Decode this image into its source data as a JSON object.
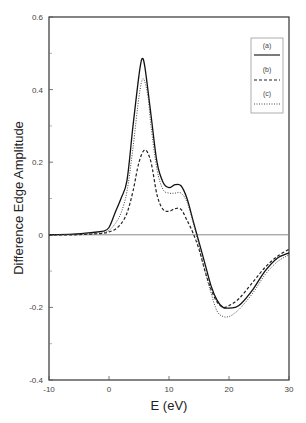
{
  "chart_data": {
    "type": "line",
    "title": "",
    "xlabel": "E (eV)",
    "ylabel": "Difference Edge Amplitude",
    "xlim": [
      -10,
      30
    ],
    "ylim": [
      -0.4,
      0.6
    ],
    "xticks": [
      -10,
      0,
      10,
      20,
      30
    ],
    "xtick_labels": [
      "-10",
      "0",
      "10",
      "20",
      "30"
    ],
    "yticks": [
      -0.4,
      -0.2,
      0,
      0.2,
      0.4,
      0.6
    ],
    "ytick_labels": [
      "-0.4",
      "-0.2",
      "0",
      "0.2",
      "0.4",
      "0.6"
    ],
    "grid": false,
    "zero_line": true,
    "legend_position": "upper right",
    "series": [
      {
        "name": "(a)",
        "style": "solid",
        "x": [
          -10,
          -6,
          -3,
          -1,
          0,
          1,
          2,
          3,
          4,
          5,
          5.5,
          6,
          7,
          8,
          9,
          10,
          11,
          12,
          13,
          14,
          15,
          16,
          17,
          18,
          19,
          20,
          21,
          22,
          24,
          26,
          28,
          30
        ],
        "y": [
          0,
          0.002,
          0.006,
          0.01,
          0.02,
          0.06,
          0.1,
          0.15,
          0.3,
          0.44,
          0.485,
          0.46,
          0.33,
          0.2,
          0.145,
          0.13,
          0.138,
          0.135,
          0.1,
          0.04,
          -0.02,
          -0.08,
          -0.14,
          -0.18,
          -0.2,
          -0.202,
          -0.2,
          -0.19,
          -0.15,
          -0.1,
          -0.065,
          -0.05
        ]
      },
      {
        "name": "(b)",
        "style": "dashed",
        "x": [
          -10,
          -6,
          -3,
          -1,
          0,
          1,
          2,
          3,
          4,
          5,
          6,
          7,
          8,
          9,
          10,
          11,
          12,
          13,
          14,
          15,
          16,
          17,
          18,
          19,
          20,
          21,
          22,
          24,
          26,
          28,
          30
        ],
        "y": [
          0,
          0,
          0.002,
          0.004,
          0.008,
          0.015,
          0.03,
          0.06,
          0.12,
          0.2,
          0.234,
          0.2,
          0.11,
          0.07,
          0.065,
          0.072,
          0.07,
          0.04,
          0.005,
          -0.04,
          -0.1,
          -0.15,
          -0.185,
          -0.2,
          -0.195,
          -0.185,
          -0.17,
          -0.13,
          -0.09,
          -0.06,
          -0.04
        ]
      },
      {
        "name": "(c)",
        "style": "dotted",
        "x": [
          -10,
          -6,
          -3,
          -1,
          0,
          1,
          2,
          3,
          4,
          5,
          5.7,
          6.5,
          7,
          8,
          9,
          10,
          11,
          12,
          13,
          14,
          15,
          16,
          17,
          18,
          19,
          20,
          21,
          22,
          24,
          26,
          28,
          30
        ],
        "y": [
          0,
          0.001,
          0.004,
          0.006,
          0.012,
          0.03,
          0.06,
          0.12,
          0.24,
          0.38,
          0.43,
          0.38,
          0.3,
          0.18,
          0.125,
          0.115,
          0.115,
          0.115,
          0.09,
          0.035,
          -0.03,
          -0.1,
          -0.16,
          -0.21,
          -0.225,
          -0.225,
          -0.215,
          -0.2,
          -0.16,
          -0.11,
          -0.075,
          -0.055
        ]
      }
    ]
  },
  "legend": {
    "items": [
      {
        "label": "(a)",
        "style": "solid"
      },
      {
        "label": "(b)",
        "style": "dashed"
      },
      {
        "label": "(c)",
        "style": "dotted"
      }
    ]
  }
}
